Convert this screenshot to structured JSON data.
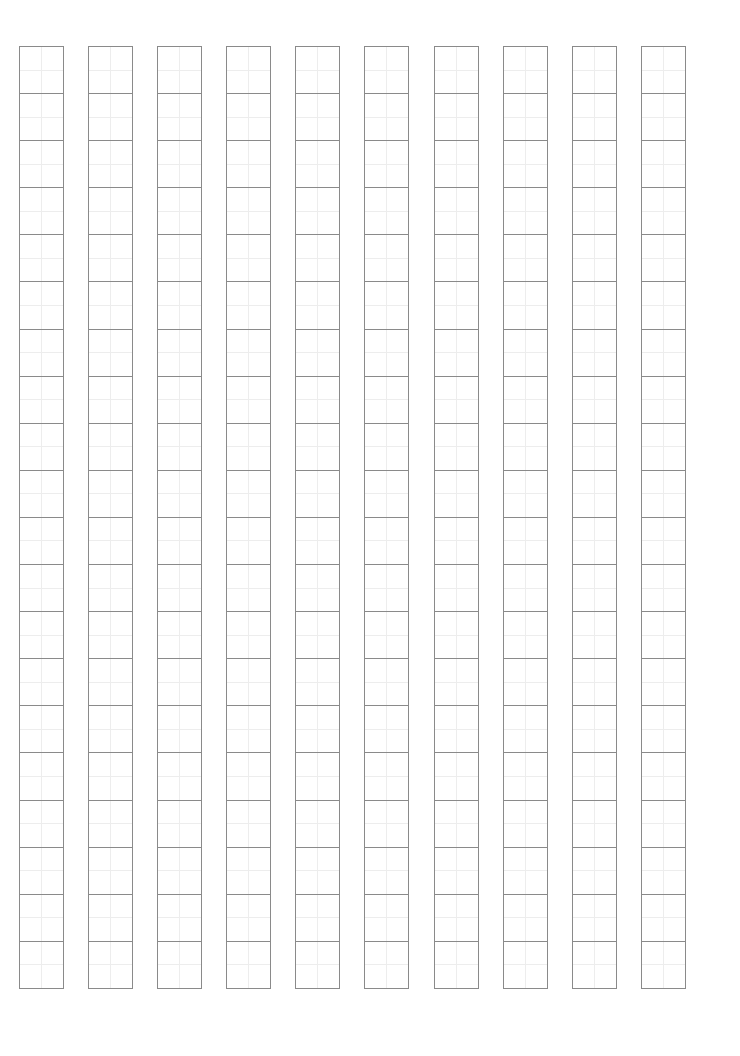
{
  "page": {
    "kind": "character-practice-grid-sheet",
    "width": 740,
    "height": 1056,
    "background_color": "#ffffff",
    "title": "",
    "header_text": "",
    "footer_text": ""
  },
  "grid": {
    "columns": 10,
    "rows": 20,
    "origin_x": 19,
    "origin_y": 46,
    "cell_width": 45,
    "cell_height": 48.1,
    "column_pitch": 69.1,
    "column_gap": 24.1,
    "row_gap": 0,
    "border_color": "#8a8a8a",
    "border_width": 1,
    "guide_color": "#ededed",
    "guide_width": 1,
    "guide_style": "center-cross",
    "cell_fill": "#ffffff"
  },
  "chart_data": {
    "type": "table",
    "title": "",
    "xlabel": "",
    "ylabel": "",
    "columns": 10,
    "rows": 20,
    "total_cells": 200,
    "categories": [
      "col-1",
      "col-2",
      "col-3",
      "col-4",
      "col-5",
      "col-6",
      "col-7",
      "col-8",
      "col-9",
      "col-10"
    ],
    "values": [
      20,
      20,
      20,
      20,
      20,
      20,
      20,
      20,
      20,
      20
    ],
    "cells": [
      [
        "",
        "",
        "",
        "",
        "",
        "",
        "",
        "",
        "",
        ""
      ],
      [
        "",
        "",
        "",
        "",
        "",
        "",
        "",
        "",
        "",
        ""
      ],
      [
        "",
        "",
        "",
        "",
        "",
        "",
        "",
        "",
        "",
        ""
      ],
      [
        "",
        "",
        "",
        "",
        "",
        "",
        "",
        "",
        "",
        ""
      ],
      [
        "",
        "",
        "",
        "",
        "",
        "",
        "",
        "",
        "",
        ""
      ],
      [
        "",
        "",
        "",
        "",
        "",
        "",
        "",
        "",
        "",
        ""
      ],
      [
        "",
        "",
        "",
        "",
        "",
        "",
        "",
        "",
        "",
        ""
      ],
      [
        "",
        "",
        "",
        "",
        "",
        "",
        "",
        "",
        "",
        ""
      ],
      [
        "",
        "",
        "",
        "",
        "",
        "",
        "",
        "",
        "",
        ""
      ],
      [
        "",
        "",
        "",
        "",
        "",
        "",
        "",
        "",
        "",
        ""
      ],
      [
        "",
        "",
        "",
        "",
        "",
        "",
        "",
        "",
        "",
        ""
      ],
      [
        "",
        "",
        "",
        "",
        "",
        "",
        "",
        "",
        "",
        ""
      ],
      [
        "",
        "",
        "",
        "",
        "",
        "",
        "",
        "",
        "",
        ""
      ],
      [
        "",
        "",
        "",
        "",
        "",
        "",
        "",
        "",
        "",
        ""
      ],
      [
        "",
        "",
        "",
        "",
        "",
        "",
        "",
        "",
        "",
        ""
      ],
      [
        "",
        "",
        "",
        "",
        "",
        "",
        "",
        "",
        "",
        ""
      ],
      [
        "",
        "",
        "",
        "",
        "",
        "",
        "",
        "",
        "",
        ""
      ],
      [
        "",
        "",
        "",
        "",
        "",
        "",
        "",
        "",
        "",
        ""
      ],
      [
        "",
        "",
        "",
        "",
        "",
        "",
        "",
        "",
        "",
        ""
      ],
      [
        "",
        "",
        "",
        "",
        "",
        "",
        "",
        "",
        "",
        ""
      ]
    ]
  }
}
